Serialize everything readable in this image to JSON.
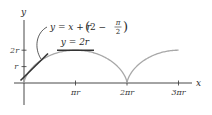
{
  "figure": {
    "type": "cycloid-tangent-diagram",
    "axes": {
      "x_label": "x",
      "y_label": "y",
      "x_ticks": [
        {
          "value_pi_r": 1,
          "label": "πr"
        },
        {
          "value_pi_r": 2,
          "label": "2πr"
        },
        {
          "value_pi_r": 3,
          "label": "3πr"
        }
      ],
      "y_ticks": [
        {
          "value_r": 1,
          "label": "r"
        },
        {
          "value_r": 2,
          "label": "2r"
        }
      ]
    },
    "curve": {
      "name": "cycloid",
      "description": "x = r(t − sin t), y = r(1 − cos t), drawn from x = 0 to x = 3πr",
      "color": "#a8a8a8"
    },
    "tangent_line": {
      "equation_prefix": "y = x + r",
      "equation_paren_open": "(",
      "equation_two_minus": "2 −",
      "equation_fraction_num": "π",
      "equation_fraction_den": "2",
      "equation_paren_close": ")",
      "color": "#333333"
    },
    "horizontal_tangent": {
      "label": "y = 2r",
      "color": "#333333"
    }
  },
  "layout": {
    "origin_px": [
      24,
      83
    ],
    "r_px": 16.4,
    "pi_r_px": 51.5
  }
}
